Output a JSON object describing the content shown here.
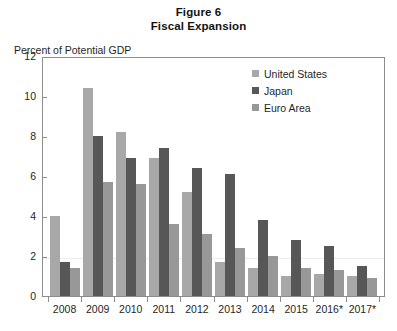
{
  "figure": {
    "title_line1": "Figure 6",
    "title_line2": "Fiscal Expansion"
  },
  "legend": {
    "position": "top-right",
    "entries": [
      {
        "label": "United States",
        "color": "#a8a8a8",
        "key": "us"
      },
      {
        "label": "Japan",
        "color": "#575757",
        "key": "jp"
      },
      {
        "label": "Euro Area",
        "color": "#989898",
        "key": "eu"
      }
    ]
  },
  "axes": {
    "ylabel": "Percent of Potential GDP",
    "yticks": [
      12,
      10,
      8,
      6,
      4,
      2,
      0
    ],
    "ytick_labels": [
      "12",
      "10",
      "8",
      "6",
      "4",
      "2",
      "0"
    ],
    "ylim": [
      0,
      12
    ],
    "xlabel": "",
    "grid": "faint-horizontal-at-2"
  },
  "chart_data": {
    "type": "bar",
    "xlabel": "",
    "ylabel": "Percent of Potential GDP",
    "ylim": [
      0,
      12
    ],
    "grid": false,
    "legend_position": "top-right",
    "categories": [
      "2008",
      "2009",
      "2010",
      "2011",
      "2012",
      "2013",
      "2014",
      "2015",
      "2016*",
      "2017*"
    ],
    "series": [
      {
        "name": "United States",
        "color": "#a8a8a8",
        "values": [
          4.0,
          10.4,
          8.2,
          6.9,
          5.2,
          1.7,
          1.4,
          1.0,
          1.1,
          1.0
        ]
      },
      {
        "name": "Japan",
        "color": "#575757",
        "values": [
          1.7,
          8.0,
          6.9,
          7.4,
          6.4,
          6.1,
          3.8,
          2.8,
          2.5,
          1.5
        ]
      },
      {
        "name": "Euro Area",
        "color": "#989898",
        "values": [
          1.4,
          5.7,
          5.6,
          3.6,
          3.1,
          2.4,
          2.0,
          1.4,
          1.3,
          0.9
        ]
      }
    ]
  }
}
